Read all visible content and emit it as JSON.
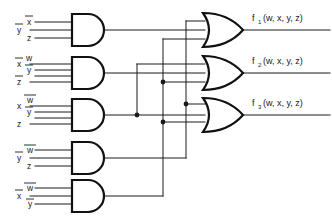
{
  "diagram": {
    "background_color": "#ffffff",
    "wire_color": "#1a1a1a",
    "gate_outline_color": "#111111"
  },
  "and_gates": [
    {
      "id": "and-gate-1",
      "label": "AND1",
      "inputs": [
        {
          "name": "x-bar",
          "text": "x",
          "overbar": true
        },
        {
          "name": "y-bar",
          "text": "y",
          "overbar": true
        },
        {
          "name": "z",
          "text": "z",
          "overbar": false
        }
      ]
    },
    {
      "id": "and-gate-2",
      "label": "AND2",
      "inputs": [
        {
          "name": "x-bar",
          "text": "x",
          "overbar": true
        },
        {
          "name": "w",
          "text": "w",
          "overbar": false
        },
        {
          "name": "y-bar",
          "text": "y",
          "overbar": true
        },
        {
          "name": "z-bar",
          "text": "z",
          "overbar": true
        }
      ]
    },
    {
      "id": "and-gate-3",
      "label": "AND3",
      "inputs": [
        {
          "name": "x",
          "text": "x",
          "overbar": false
        },
        {
          "name": "w-bar",
          "text": "w",
          "overbar": true
        },
        {
          "name": "y-bar",
          "text": "y",
          "overbar": true
        },
        {
          "name": "z",
          "text": "z",
          "overbar": false
        }
      ]
    },
    {
      "id": "and-gate-4",
      "label": "AND4",
      "inputs": [
        {
          "name": "y-bar",
          "text": "y",
          "overbar": true
        },
        {
          "name": "w-bar",
          "text": "w",
          "overbar": true
        },
        {
          "name": "z",
          "text": "z",
          "overbar": false
        }
      ]
    },
    {
      "id": "and-gate-5",
      "label": "AND5",
      "inputs": [
        {
          "name": "x-bar",
          "text": "x",
          "overbar": true
        },
        {
          "name": "w-bar",
          "text": "w",
          "overbar": true
        },
        {
          "name": "y-bar",
          "text": "y",
          "overbar": true
        }
      ]
    }
  ],
  "or_gates": [
    {
      "id": "or-gate-1",
      "output_base": "f",
      "output_sub": "1",
      "output_args": "(w, x, y, z)"
    },
    {
      "id": "or-gate-2",
      "output_base": "f",
      "output_sub": "2",
      "output_args": "(w, x, y, z)"
    },
    {
      "id": "or-gate-3",
      "output_base": "f",
      "output_sub": "3",
      "output_args": "(w, x, y, z)"
    }
  ],
  "outputs": [
    {
      "name": "f1-output-label",
      "base": "f",
      "sub": "1",
      "args": "(w, x, y, z)"
    },
    {
      "name": "f2-output-label",
      "base": "f",
      "sub": "2",
      "args": "(w, x, y, z)"
    },
    {
      "name": "f3-output-label",
      "base": "f",
      "sub": "3",
      "args": "(w, x, y, z)"
    }
  ],
  "junctions": [
    {
      "name": "junction-and3-branch",
      "x": 137,
      "y": 115
    },
    {
      "name": "junction-and5-upper",
      "x": 163,
      "y": 73
    },
    {
      "name": "junction-and5-lower",
      "x": 163,
      "y": 122
    },
    {
      "name": "junction-and4-branch",
      "x": 186,
      "y": 104
    }
  ]
}
